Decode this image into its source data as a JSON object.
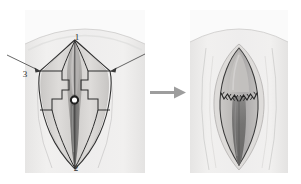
{
  "figure": {
    "panels": [
      {
        "id": "preop",
        "name": "Planned flap incisions",
        "labels": [
          {
            "text": "1",
            "meaning": "clitoral-hood-apex",
            "x": 77,
            "y": 38
          },
          {
            "text": "2",
            "meaning": "posterior-fourchette",
            "x": 76,
            "y": 168
          },
          {
            "text": "3",
            "meaning": "lateral-flap-apex",
            "x": 26,
            "y": 74
          }
        ],
        "pointers": [
          {
            "name": "left-pointer",
            "from_x": 8,
            "from_y": 56,
            "to_x": 40,
            "to_y": 72
          },
          {
            "name": "right-pointer",
            "from_x": 144,
            "from_y": 55,
            "to_x": 111,
            "to_y": 72
          }
        ],
        "marker": {
          "name": "urethral-meatus-ring",
          "x": 74,
          "y": 100,
          "r": 3.6
        }
      },
      {
        "id": "postop",
        "name": "Closed and sutured result",
        "sutures": [
          {
            "name": "left-suture-line"
          },
          {
            "name": "right-suture-line"
          }
        ]
      }
    ],
    "arrow": {
      "name": "progression-arrow",
      "direction": "right"
    },
    "colors": {
      "background": "#ffffff",
      "skin_light": "#eeeded",
      "skin_mid": "#d9d8d6",
      "skin_shadow": "#b9b7b5",
      "mucosa": "#a7a5a3",
      "introitus_dark": "#6f6e6e",
      "outline": "#2e2e2e",
      "faint_line": "#b4b3b2",
      "arrow": "#9a9a9a",
      "label_text": "#2c2c2c"
    }
  }
}
